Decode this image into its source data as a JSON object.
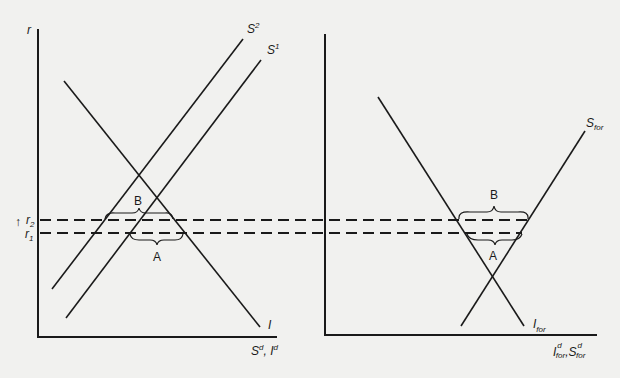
{
  "figure": {
    "left_panel": {
      "y_axis_label": "r",
      "x_axis_label": "S",
      "x_axis_label_sup": "d",
      "x_axis_label_sep": ", ",
      "x_axis_label_2": "I",
      "x_axis_label_2_sup": "d",
      "curves": {
        "investment": "I",
        "saving_2": "S",
        "saving_2_sup": "2",
        "saving_1": "S",
        "saving_1_sup": "1"
      },
      "rate_labels": {
        "r2": "r",
        "r2_sub": "2",
        "r1": "r",
        "r1_sub": "1",
        "arrow": "↑"
      },
      "brace_labels": {
        "upper": "B",
        "lower": "A"
      }
    },
    "right_panel": {
      "x_axis_label": "I",
      "x_axis_label_sub": "for",
      "x_axis_label_sup": "d",
      "x_axis_label_sep": ",",
      "x_axis_label_2": "S",
      "x_axis_label_2_sub": "for",
      "x_axis_label_2_sup": "d",
      "curves": {
        "foreign_saving": "S",
        "foreign_saving_sub": "for",
        "foreign_investment": "I",
        "foreign_investment_sub": "for"
      },
      "brace_labels": {
        "upper": "B",
        "lower": "A"
      }
    }
  }
}
